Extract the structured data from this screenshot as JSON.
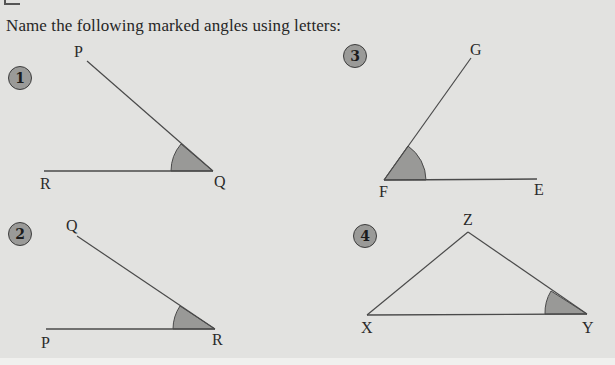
{
  "exercise": {
    "instruction": "Name the following marked angles using letters:",
    "colors": {
      "background": "#e2e2e0",
      "line": "#4a4a4a",
      "angle_fill": "#999997",
      "badge_fill": "#9a9a98"
    },
    "figures": [
      {
        "number": "1",
        "points": {
          "P": "P",
          "Q": "Q",
          "R": "R"
        },
        "marked_vertex": "Q"
      },
      {
        "number": "2",
        "points": {
          "Q": "Q",
          "R": "R",
          "P": "P"
        },
        "marked_vertex": "R"
      },
      {
        "number": "3",
        "points": {
          "G": "G",
          "F": "F",
          "E": "E"
        },
        "marked_vertex": "F"
      },
      {
        "number": "4",
        "points": {
          "Z": "Z",
          "X": "X",
          "Y": "Y"
        },
        "marked_vertex": "Y"
      }
    ]
  }
}
